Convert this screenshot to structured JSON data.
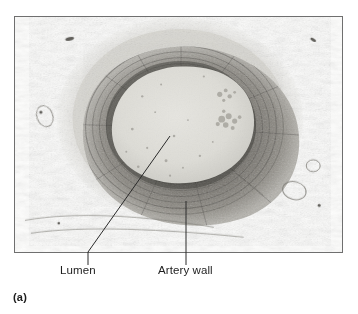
{
  "figure": {
    "panel_letter": "(a)",
    "labels": [
      {
        "id": "lumen",
        "text": "Lumen"
      },
      {
        "id": "artery_wall",
        "text": "Artery wall"
      }
    ]
  },
  "micrograph": {
    "description": "light-micrograph-artery-transverse-section",
    "frame": {
      "x": 14,
      "y": 16,
      "width": 329,
      "height": 237
    },
    "regions": [
      {
        "name": "lumen",
        "shape": "ellipse",
        "cx": 181,
        "cy": 119,
        "rx": 62,
        "ry": 51,
        "color": "#dddcd6"
      },
      {
        "name": "tunica-media",
        "shape": "annulus",
        "cx": 179,
        "cy": 116,
        "rx": 99,
        "ry": 86,
        "color": "#7d7a74"
      },
      {
        "name": "tunica-adventitia",
        "shape": "annulus",
        "cx": 179,
        "cy": 116,
        "rx": 120,
        "ry": 104,
        "color": "#c9c7c1"
      },
      {
        "name": "surrounding-tissue",
        "shape": "background",
        "color": "#fbfbfa"
      }
    ]
  },
  "colors": {
    "frame_border": "#6f6f6f",
    "leader_line": "#2a2a2a",
    "label_text": "#1d1d1d",
    "lumen_fill": "#dddcd6",
    "media_dark": "#6e6b65",
    "media_mid": "#86837c",
    "adventitia": "#c9c7c1",
    "background": "#ffffff"
  }
}
